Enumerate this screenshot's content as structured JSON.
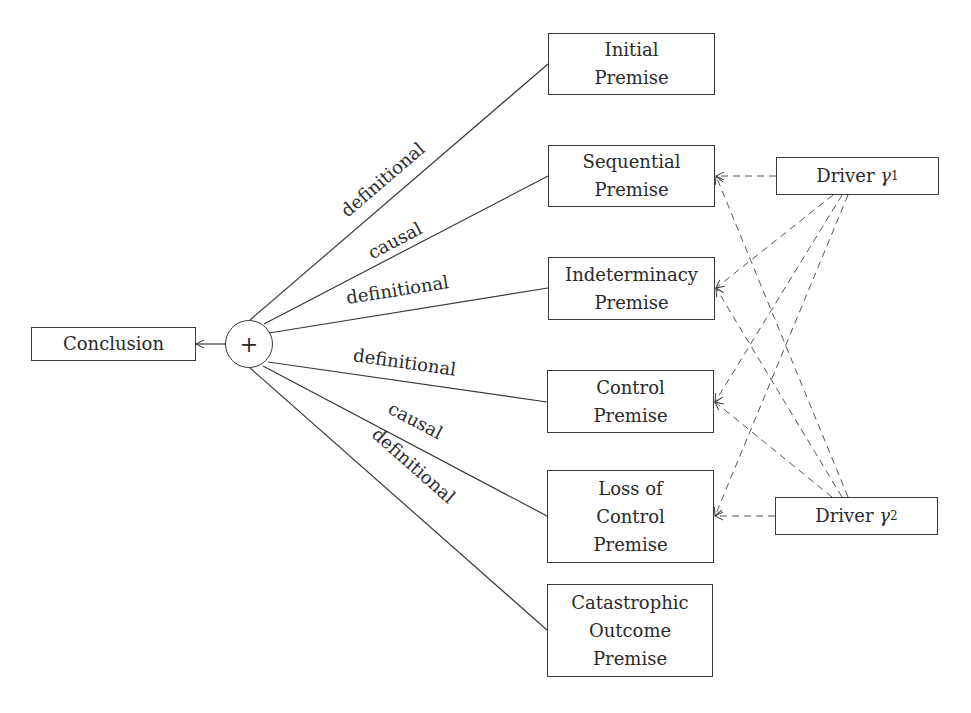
{
  "diagram": {
    "conclusion": {
      "label": "Conclusion"
    },
    "aggregator": {
      "symbol": "+"
    },
    "premises": [
      {
        "id": "initial",
        "lines": [
          "Initial",
          "Premise"
        ],
        "edge_label": "definitional"
      },
      {
        "id": "sequential",
        "lines": [
          "Sequential",
          "Premise"
        ],
        "edge_label": "causal"
      },
      {
        "id": "indeterminacy",
        "lines": [
          "Indeterminacy",
          "Premise"
        ],
        "edge_label": "definitional"
      },
      {
        "id": "control",
        "lines": [
          "Control",
          "Premise"
        ],
        "edge_label": "definitional"
      },
      {
        "id": "loss-of-control",
        "lines": [
          "Loss of",
          "Control",
          "Premise"
        ],
        "edge_label": "causal"
      },
      {
        "id": "catastrophic",
        "lines": [
          "Catastrophic",
          "Outcome",
          "Premise"
        ],
        "edge_label": "definitional"
      }
    ],
    "drivers": [
      {
        "id": "driver-1",
        "label": "Driver",
        "symbol": "γ",
        "subscript": "1",
        "targets": [
          "sequential",
          "indeterminacy",
          "control",
          "loss-of-control"
        ]
      },
      {
        "id": "driver-2",
        "label": "Driver",
        "symbol": "γ",
        "subscript": "2",
        "targets": [
          "sequential",
          "indeterminacy",
          "control",
          "loss-of-control"
        ]
      }
    ],
    "colors": {
      "line": "#3a3a3a",
      "dashed": "#555555",
      "text": "#2a2a2a"
    }
  }
}
